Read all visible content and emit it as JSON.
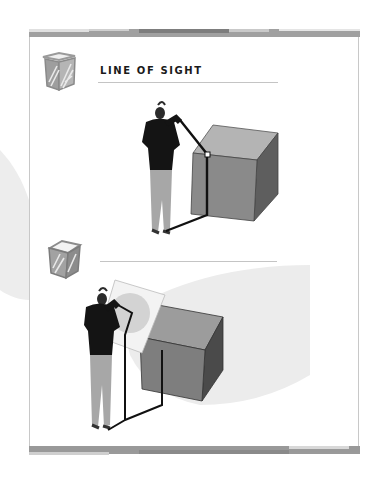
{
  "page": {
    "type": "scanned book page",
    "background": "#ffffff",
    "frame_color": "#c8c8c8",
    "band_color": "#9a9a9a"
  },
  "section1": {
    "icon": "sketched-cube-icon",
    "title": "LINE OF SIGHT",
    "illustration": "woman-sighting-cube-with-line-of-sight",
    "colors": {
      "cube_front": "#8a8a8a",
      "cube_top": "#b4b4b4",
      "cube_side": "#5e5e5e",
      "sight_line": "#111111"
    }
  },
  "section2": {
    "icon": "sketched-cube-icon",
    "title": "",
    "illustration": "woman-sighting-cube-through-picture-plane-with-cone-of-vision",
    "colors": {
      "cone": "#ececec",
      "picture_plane": "#f3f3f3",
      "circle": "#d3d3d3",
      "cube_front": "#7e7e7e",
      "cube_top": "#9c9c9c",
      "cube_side": "#4a4a4a"
    }
  }
}
